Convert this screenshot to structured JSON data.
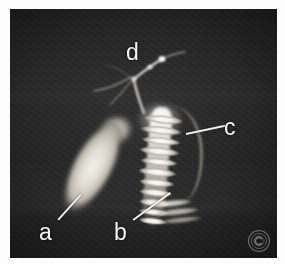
{
  "figure": {
    "type": "medical-image",
    "modality_appearance": "grayscale radiographic / MR cholangiopancreatography panel",
    "alt_description": "Dark grayscale medical scan showing bright branching ductal structures with four lettered annotations",
    "panel": {
      "background_color": "#1d1d1d",
      "border_color": "#ffffff",
      "left": 10,
      "top": 9,
      "width": 267,
      "height": 249
    },
    "label_color": "#f4f4f2",
    "leader_color": "#eeeeec"
  },
  "annotations": [
    {
      "id": "a",
      "label": "a",
      "name": "label-a",
      "x": 39,
      "y": 221,
      "leader": {
        "x": 58,
        "y": 219,
        "length": 34,
        "angle": -48
      }
    },
    {
      "id": "b",
      "label": "b",
      "name": "label-b",
      "x": 114,
      "y": 221,
      "leader": {
        "x": 133,
        "y": 219,
        "length": 46,
        "angle": -36
      }
    },
    {
      "id": "c",
      "label": "c",
      "name": "label-c",
      "x": 224,
      "y": 116,
      "leader": {
        "x": 186,
        "y": 133,
        "length": 40,
        "angle": -12
      }
    },
    {
      "id": "d",
      "label": "d",
      "name": "label-d",
      "x": 126,
      "y": 41,
      "leader": null
    }
  ],
  "structures": [
    {
      "name": "gallbladder",
      "letter": "a"
    },
    {
      "name": "duodenum-duct",
      "letter": "b"
    },
    {
      "name": "common-bile-duct",
      "letter": "c"
    },
    {
      "name": "intrahepatic-ducts",
      "letter": "d"
    }
  ],
  "watermark": {
    "name": "copyright-watermark",
    "glyph": "©"
  }
}
